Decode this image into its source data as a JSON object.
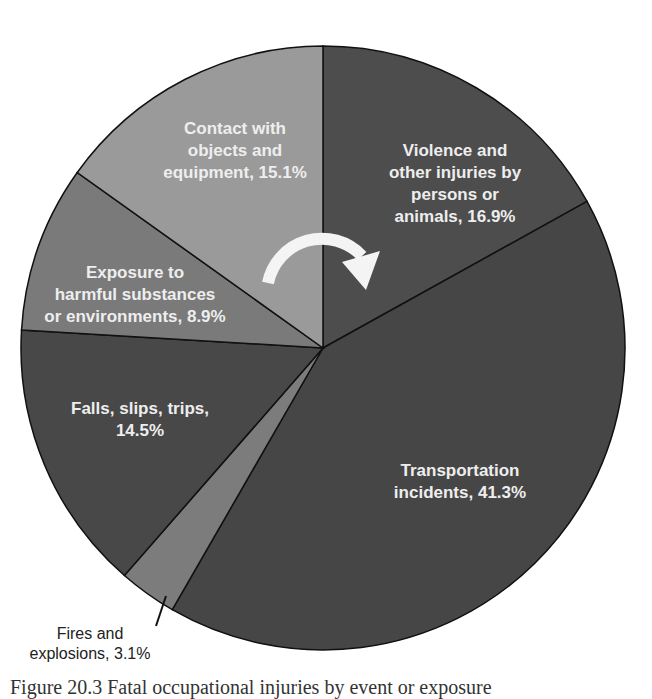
{
  "chart_data": {
    "type": "pie",
    "title": "",
    "start_angle_deg": 0,
    "direction": "clockwise",
    "slices": [
      {
        "label": "Violence and other injuries by persons or animals",
        "value": 16.9,
        "color": "#4d4d4d"
      },
      {
        "label": "Transportation incidents",
        "value": 41.3,
        "color": "#464646"
      },
      {
        "label": "Fires and explosions",
        "value": 3.1,
        "color": "#7c7c7c"
      },
      {
        "label": "Falls, slips, trips",
        "value": 14.5,
        "color": "#484848"
      },
      {
        "label": "Exposure to harmful substances or environments",
        "value": 8.9,
        "color": "#7a7a7a"
      },
      {
        "label": "Contact with objects and equipment",
        "value": 15.1,
        "color": "#9a9a9a"
      }
    ],
    "annotations": [
      "clockwise arrow (white) indicating reading direction"
    ]
  },
  "labels": {
    "violence": [
      "Violence and",
      "other injuries by",
      "persons or",
      "animals, 16.9%"
    ],
    "transport": [
      "Transportation",
      "incidents, 41.3%"
    ],
    "fires": [
      "Fires and",
      "explosions, 3.1%"
    ],
    "falls": [
      "Falls, slips, trips,",
      "14.5%"
    ],
    "exposure": [
      "Exposure to",
      "harmful substances",
      "or environments, 8.9%"
    ],
    "contact": [
      "Contact with",
      "objects and",
      "equipment, 15.1%"
    ]
  },
  "caption": "Figure 20.3  Fatal occupational injuries by event or exposure"
}
